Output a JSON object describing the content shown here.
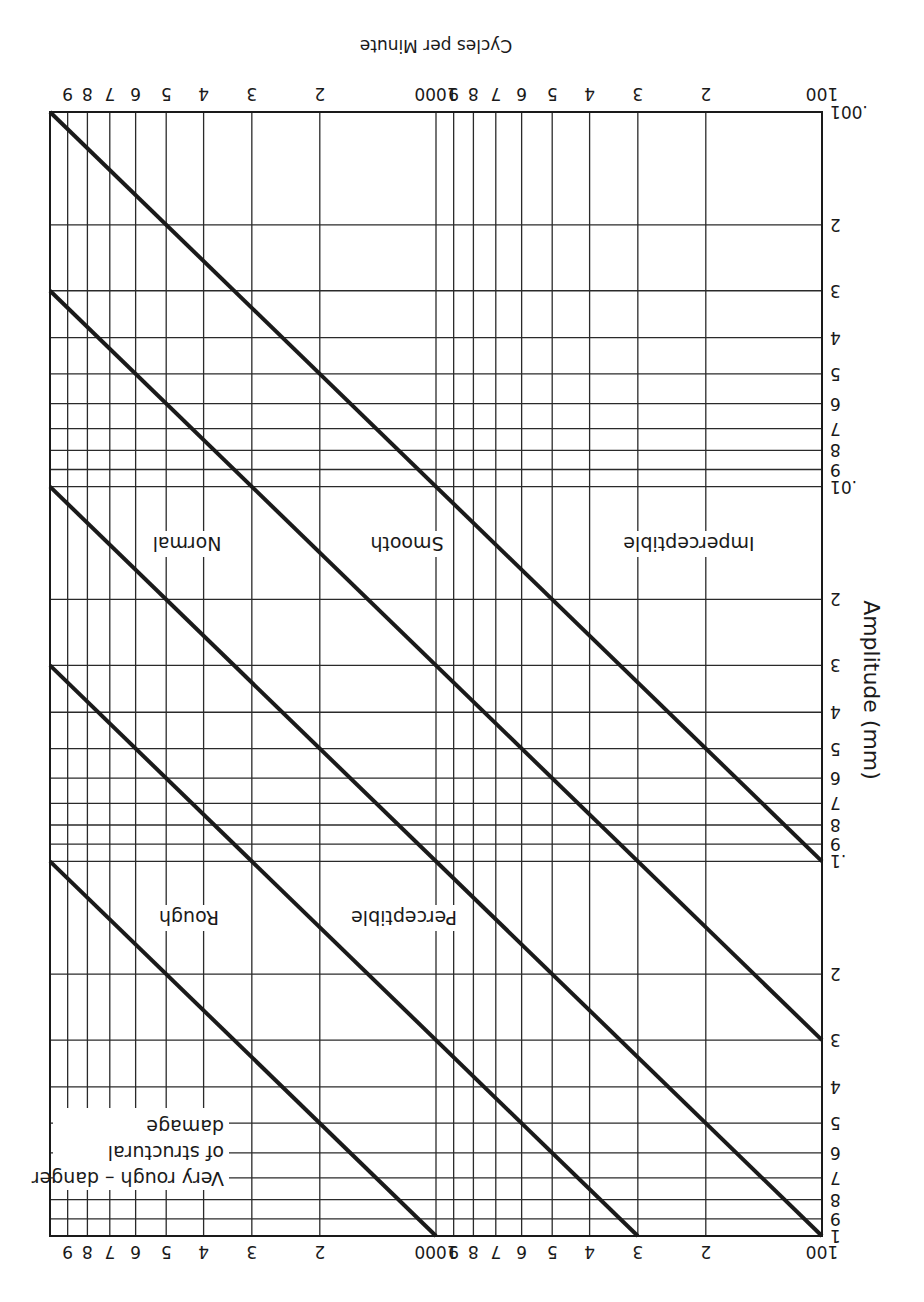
{
  "page": {
    "orientation": "rotated 180 degrees (upside down)"
  },
  "chart_data": {
    "type": "line",
    "title": "",
    "xlabel": "Cycles per Minute",
    "ylabel": "Amplitude (mm)",
    "x_scale": "log",
    "y_scale": "log",
    "xlim": [
      100,
      10000
    ],
    "ylim": [
      0.001,
      1
    ],
    "grid": true,
    "legend_position": "none (zone labels placed between lines)",
    "x_tick_labels": [
      "100",
      "2",
      "3",
      "4",
      "5",
      "6",
      "7",
      "8",
      "9",
      "1000",
      "2",
      "3",
      "4",
      "5",
      "6",
      "7",
      "8",
      "9"
    ],
    "x_tick_values": [
      100,
      200,
      300,
      400,
      500,
      600,
      700,
      800,
      900,
      1000,
      2000,
      3000,
      4000,
      5000,
      6000,
      7000,
      8000,
      9000
    ],
    "y_tick_labels_top": [
      ".001",
      "2",
      "3",
      "4",
      "5",
      "6",
      "7",
      "8",
      "9",
      ".01",
      "2",
      "3",
      "4",
      "5",
      "6",
      "7",
      "8",
      "9",
      ".1",
      "2",
      "3",
      "4",
      "5",
      "6",
      "7",
      "8",
      "9",
      "1"
    ],
    "y_tick_values": [
      0.001,
      0.002,
      0.003,
      0.004,
      0.005,
      0.006,
      0.007,
      0.008,
      0.009,
      0.01,
      0.02,
      0.03,
      0.04,
      0.05,
      0.06,
      0.07,
      0.08,
      0.09,
      0.1,
      0.2,
      0.3,
      0.4,
      0.5,
      0.6,
      0.7,
      0.8,
      0.9,
      1
    ],
    "y_tick_labels_bottom_axis": [
      "1",
      "9",
      "8",
      "7",
      "6",
      "5",
      "4",
      "3",
      "2",
      ".1",
      "9",
      "8",
      "7",
      "6",
      "5",
      "4",
      "3",
      "2",
      ".01",
      "9",
      "8",
      "7",
      "6",
      "5",
      "4",
      "3",
      "2",
      ".001"
    ],
    "series": [
      {
        "name": "Boundary 1 (Imperceptible / Smooth)",
        "x": [
          100,
          10000
        ],
        "y": [
          0.1,
          0.001
        ]
      },
      {
        "name": "Boundary 2 (Smooth / Normal)",
        "x": [
          100,
          10000
        ],
        "y": [
          0.3,
          0.003
        ]
      },
      {
        "name": "Boundary 3 (Normal / Perceptible)",
        "x": [
          100,
          10000
        ],
        "y": [
          1.0,
          0.01
        ]
      },
      {
        "name": "Boundary 4 (Perceptible / Rough)",
        "x": [
          300,
          10000
        ],
        "y": [
          1.0,
          0.03
        ]
      },
      {
        "name": "Boundary 5 (Rough / Very rough)",
        "x": [
          1000,
          10000
        ],
        "y": [
          1.0,
          0.1
        ]
      }
    ],
    "zones": [
      {
        "label": "Imperceptible",
        "approx_x": 180,
        "approx_y": 0.015
      },
      {
        "label": "Smooth",
        "approx_x": 1300,
        "approx_y": 0.015
      },
      {
        "label": "Normal",
        "approx_x": 4500,
        "approx_y": 0.015
      },
      {
        "label": "Perceptible",
        "approx_x": 1300,
        "approx_y": 0.15
      },
      {
        "label": "Rough",
        "approx_x": 4500,
        "approx_y": 0.15
      },
      {
        "label": "Very rough – danger of structural damage",
        "approx_x": 4500,
        "approx_y": 0.6
      }
    ],
    "annotations": [
      "Imperceptible",
      "Smooth",
      "Normal",
      "Perceptible",
      "Rough",
      "Very rough – danger",
      "of structural",
      "damage"
    ]
  },
  "labels": {
    "x_axis_title": "Cycles per Minute",
    "y_axis_title": "Amplitude (mm)",
    "zone_imperceptible": "Imperceptible",
    "zone_smooth": "Smooth",
    "zone_normal": "Normal",
    "zone_perceptible": "Perceptible",
    "zone_rough": "Rough",
    "zone_very_rough_1": "Very rough – danger",
    "zone_very_rough_2": "of structural",
    "zone_very_rough_3": "damage"
  },
  "x_axis_top": [
    "100",
    "2",
    "3",
    "4",
    "5",
    "6",
    "7",
    "8",
    "9",
    "1000",
    "2",
    "3",
    "4",
    "5",
    "6",
    "7",
    "8",
    "9"
  ],
  "x_axis_bottom": [
    "100",
    "2",
    "3",
    "4",
    "5",
    "6",
    "7",
    "8",
    "9",
    "1000",
    "2",
    "3",
    "4",
    "5",
    "6",
    "7",
    "8",
    "9"
  ],
  "y_axis": [
    ".001",
    "2",
    "3",
    "4",
    "5",
    "6",
    "7",
    "8",
    "9",
    ".01",
    "2",
    "3",
    "4",
    "5",
    "6",
    "7",
    "8",
    "9",
    ".1",
    "2",
    "3",
    "4",
    "5",
    "6",
    "7",
    "8",
    "9",
    "1"
  ],
  "colors": {
    "ink": "#1a1a1a",
    "paper": "#ffffff"
  }
}
